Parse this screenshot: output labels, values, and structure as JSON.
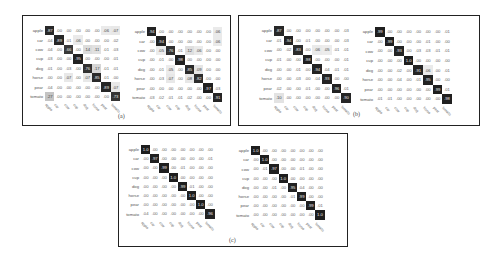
{
  "labels": [
    "apple",
    "car",
    "cow",
    "cup",
    "dog",
    "horse",
    "pear",
    "tomato"
  ],
  "captions": {
    "a": "(a)",
    "b": "(b)",
    "c": "(c)"
  },
  "chart_data": [
    {
      "type": "heatmap",
      "panel": "a",
      "side": "left",
      "rows": [
        "apple",
        "car",
        "cow",
        "cup",
        "dog",
        "horse",
        "pear",
        "tomato"
      ],
      "cols": [
        "apple",
        "car",
        "cow",
        "cup",
        "dog",
        "horse",
        "pear",
        "tomato"
      ],
      "values": [
        [
          ".87",
          ".00",
          ".00",
          ".00",
          ".00",
          ".00",
          ".06",
          ".07"
        ],
        [
          ".04",
          ".89",
          ".01",
          ".06",
          ".00",
          ".00",
          ".00",
          ".02"
        ],
        [
          ".04",
          ".00",
          ".66",
          ".00",
          ".14",
          ".11",
          ".01",
          ".03"
        ],
        [
          ".03",
          ".00",
          ".00",
          ".95",
          ".00",
          ".00",
          ".00",
          ".01"
        ],
        [
          ".01",
          ".00",
          ".03",
          ".00",
          ".76",
          ".17",
          ".01",
          ".01"
        ],
        [
          ".00",
          ".00",
          ".07",
          ".00",
          ".07",
          ".85",
          ".01",
          ".00"
        ],
        [
          ".04",
          ".00",
          ".00",
          ".00",
          ".00",
          ".00",
          ".89",
          ".07"
        ],
        [
          ".27",
          ".00",
          ".00",
          ".00",
          ".00",
          ".00",
          ".00",
          ".73"
        ]
      ]
    },
    {
      "type": "heatmap",
      "panel": "a",
      "side": "right",
      "rows": [
        "apple",
        "car",
        "cow",
        "cup",
        "dog",
        "horse",
        "pear",
        "tomato"
      ],
      "cols": [
        "apple",
        "car",
        "cow",
        "cup",
        "dog",
        "horse",
        "pear",
        "tomato"
      ],
      "values": [
        [
          ".94",
          ".00",
          ".00",
          ".00",
          ".00",
          ".00",
          ".00",
          ".06"
        ],
        [
          ".00",
          ".94",
          ".00",
          ".00",
          ".00",
          ".00",
          ".00",
          ".06"
        ],
        [
          ".00",
          ".05",
          ".76",
          ".01",
          ".12",
          ".06",
          ".00",
          ".00"
        ],
        [
          ".00",
          ".01",
          ".00",
          ".98",
          ".00",
          ".00",
          ".00",
          ".00"
        ],
        [
          ".00",
          ".01",
          ".05",
          ".00",
          ".85",
          ".09",
          ".00",
          ".00"
        ],
        [
          ".00",
          ".03",
          ".07",
          ".00",
          ".08",
          ".82",
          ".00",
          ".00"
        ],
        [
          ".00",
          ".00",
          ".00",
          ".00",
          ".00",
          ".00",
          ".97",
          ".03"
        ],
        [
          ".03",
          ".02",
          ".01",
          ".01",
          ".02",
          ".00",
          ".00",
          ".91"
        ]
      ]
    },
    {
      "type": "heatmap",
      "panel": "b",
      "side": "left",
      "rows": [
        "apple",
        "car",
        "cow",
        "cup",
        "dog",
        "horse",
        "pear",
        "tomato"
      ],
      "cols": [
        "apple",
        "car",
        "cow",
        "cup",
        "dog",
        "horse",
        "pear",
        "tomato"
      ],
      "values": [
        [
          ".87",
          ".00",
          ".00",
          ".00",
          ".00",
          ".00",
          ".00",
          ".03"
        ],
        [
          ".01",
          ".94",
          ".00",
          ".01",
          ".00",
          ".00",
          ".00",
          ".03"
        ],
        [
          ".00",
          ".02",
          ".83",
          ".00",
          ".06",
          ".05",
          ".01",
          ".01"
        ],
        [
          ".01",
          ".00",
          ".00",
          ".98",
          ".00",
          ".00",
          ".00",
          ".01"
        ],
        [
          ".00",
          ".00",
          ".01",
          ".00",
          ".94",
          ".04",
          ".01",
          ".01"
        ],
        [
          ".00",
          ".00",
          ".03",
          ".00",
          ".04",
          ".93",
          ".00",
          ".00"
        ],
        [
          ".02",
          ".00",
          ".00",
          ".01",
          ".00",
          ".00",
          ".96",
          ".01"
        ],
        [
          ".10",
          ".00",
          ".00",
          ".00",
          ".00",
          ".00",
          ".00",
          ".90"
        ]
      ]
    },
    {
      "type": "heatmap",
      "panel": "b",
      "side": "right",
      "rows": [
        "apple",
        "car",
        "cow",
        "cup",
        "dog",
        "horse",
        "pear",
        "tomato"
      ],
      "cols": [
        "apple",
        "car",
        "cow",
        "cup",
        "dog",
        "horse",
        "pear",
        "tomato"
      ],
      "values": [
        [
          ".99",
          ".00",
          ".00",
          ".00",
          ".00",
          ".00",
          ".00",
          ".01"
        ],
        [
          ".00",
          ".99",
          ".00",
          ".00",
          ".00",
          ".01",
          ".00",
          ".00"
        ],
        [
          ".00",
          ".00",
          ".93",
          ".00",
          ".03",
          ".03",
          ".01",
          ".01"
        ],
        [
          ".00",
          ".00",
          ".00",
          "1.0",
          ".00",
          ".00",
          ".00",
          ".00"
        ],
        [
          ".00",
          ".00",
          ".02",
          ".00",
          ".91",
          ".06",
          ".00",
          ".01"
        ],
        [
          ".00",
          ".00",
          ".04",
          ".00",
          ".01",
          ".95",
          ".00",
          ".00"
        ],
        [
          ".00",
          ".00",
          ".00",
          ".00",
          ".00",
          ".00",
          ".99",
          ".01"
        ],
        [
          ".01",
          ".01",
          ".00",
          ".00",
          ".00",
          ".00",
          ".00",
          ".98"
        ]
      ]
    },
    {
      "type": "heatmap",
      "panel": "c",
      "side": "left",
      "rows": [
        "apple",
        "car",
        "cow",
        "cup",
        "dog",
        "horse",
        "pear",
        "tomato"
      ],
      "cols": [
        "apple",
        "car",
        "cow",
        "cup",
        "dog",
        "horse",
        "pear",
        "tomato"
      ],
      "values": [
        [
          "1.0",
          ".00",
          ".00",
          ".00",
          ".00",
          ".00",
          ".00",
          ".00"
        ],
        [
          ".00",
          ".97",
          ".00",
          ".00",
          ".00",
          ".00",
          ".00",
          ".01"
        ],
        [
          ".00",
          ".00",
          ".99",
          ".00",
          ".01",
          ".00",
          ".00",
          ".00"
        ],
        [
          ".00",
          ".00",
          ".00",
          "1.0",
          ".00",
          ".00",
          ".00",
          ".00"
        ],
        [
          ".00",
          ".00",
          ".00",
          ".00",
          ".99",
          ".01",
          ".00",
          ".00"
        ],
        [
          ".00",
          ".00",
          ".00",
          ".00",
          ".00",
          "1.0",
          ".00",
          ".00"
        ],
        [
          ".00",
          ".00",
          ".00",
          ".00",
          ".00",
          ".00",
          "1.0",
          ".00"
        ],
        [
          ".04",
          ".00",
          ".00",
          ".00",
          ".00",
          ".00",
          ".00",
          ".96"
        ]
      ]
    },
    {
      "type": "heatmap",
      "panel": "c",
      "side": "right",
      "rows": [
        "apple",
        "car",
        "cow",
        "cup",
        "dog",
        "horse",
        "pear",
        "tomato"
      ],
      "cols": [
        "apple",
        "car",
        "cow",
        "cup",
        "dog",
        "horse",
        "pear",
        "tomato"
      ],
      "values": [
        [
          "1.0",
          ".00",
          ".00",
          ".00",
          ".00",
          ".00",
          ".00",
          ".00"
        ],
        [
          ".00",
          "1.0",
          ".00",
          ".00",
          ".00",
          ".00",
          ".00",
          ".00"
        ],
        [
          ".00",
          ".01",
          ".97",
          ".00",
          ".00",
          ".01",
          ".00",
          ".00"
        ],
        [
          ".00",
          ".00",
          ".00",
          "1.0",
          ".00",
          ".00",
          ".00",
          ".00"
        ],
        [
          ".00",
          ".00",
          ".01",
          ".00",
          ".95",
          ".04",
          ".00",
          ".00"
        ],
        [
          ".00",
          ".00",
          ".00",
          ".00",
          ".01",
          ".99",
          ".00",
          ".00"
        ],
        [
          ".00",
          ".00",
          ".00",
          ".00",
          ".00",
          ".00",
          ".99",
          ".01"
        ],
        [
          ".00",
          ".00",
          ".00",
          ".00",
          ".00",
          ".00",
          ".00",
          "1.0"
        ]
      ]
    }
  ]
}
